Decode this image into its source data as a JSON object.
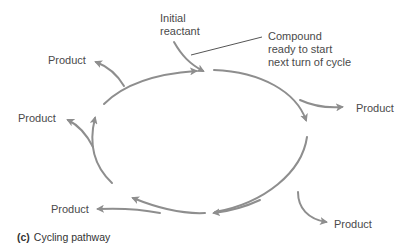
{
  "diagram": {
    "type": "cycle",
    "colors": {
      "arrow": "#8e8e8e",
      "leader": "#555555",
      "text": "#4a4a4a"
    },
    "labels": {
      "initial_reactant": [
        "Initial",
        "reactant"
      ],
      "compound": [
        "Compound",
        "ready to start",
        "next turn of cycle"
      ],
      "product_top_left": "Product",
      "product_left": "Product",
      "product_bottom_left": "Product",
      "product_right": "Product",
      "product_bottom_right": "Product"
    },
    "nodes": [
      {
        "id": "initial_reactant",
        "label": "Initial reactant",
        "role": "input"
      },
      {
        "id": "cycle",
        "label": "Cycling pathway",
        "role": "cycle"
      },
      {
        "id": "compound",
        "label": "Compound ready to start next turn of cycle",
        "role": "annotation"
      },
      {
        "id": "p1",
        "label": "Product",
        "role": "output"
      },
      {
        "id": "p2",
        "label": "Product",
        "role": "output"
      },
      {
        "id": "p3",
        "label": "Product",
        "role": "output"
      },
      {
        "id": "p4",
        "label": "Product",
        "role": "output"
      },
      {
        "id": "p5",
        "label": "Product",
        "role": "output"
      }
    ],
    "direction": "clockwise"
  },
  "caption": {
    "tag": "(c)",
    "text": "Cycling pathway"
  }
}
